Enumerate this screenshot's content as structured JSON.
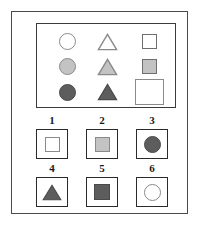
{
  "palette": {
    "white_fill": "#ffffff",
    "light_gray_fill": "#c3c3c3",
    "dark_gray_fill": "#5d5d5d",
    "shape_outline": "#8a8a8a",
    "dark_outline": "#4a4a4a",
    "frame": "#3a3a3a",
    "text": "#1a1a1a"
  },
  "puzzle": {
    "type": "matrix-reasoning",
    "rows": 3,
    "columns": 3,
    "missing_cell": {
      "row": 3,
      "column": 3
    },
    "rule_row": "shading progresses white, light gray, dark gray down each column",
    "rule_column": "shape is constant within a column: circle, triangle, square"
  },
  "matrix": {
    "name": "stimulus-matrix",
    "cells": [
      {
        "id": "cell-r1c1",
        "row": 1,
        "column": 1,
        "shape": "circle",
        "fill": "white",
        "label": "white circle"
      },
      {
        "id": "cell-r1c2",
        "row": 1,
        "column": 2,
        "shape": "triangle",
        "fill": "white",
        "label": "white triangle"
      },
      {
        "id": "cell-r1c3",
        "row": 1,
        "column": 3,
        "shape": "square",
        "fill": "white",
        "label": "white square"
      },
      {
        "id": "cell-r2c1",
        "row": 2,
        "column": 1,
        "shape": "circle",
        "fill": "light-gray",
        "label": "light gray circle"
      },
      {
        "id": "cell-r2c2",
        "row": 2,
        "column": 2,
        "shape": "triangle",
        "fill": "light-gray",
        "label": "light gray triangle"
      },
      {
        "id": "cell-r2c3",
        "row": 2,
        "column": 3,
        "shape": "square",
        "fill": "light-gray",
        "label": "light gray square"
      },
      {
        "id": "cell-r3c1",
        "row": 3,
        "column": 1,
        "shape": "circle",
        "fill": "dark-gray",
        "label": "dark gray circle"
      },
      {
        "id": "cell-r3c2",
        "row": 3,
        "column": 2,
        "shape": "triangle",
        "fill": "dark-gray",
        "label": "dark gray triangle"
      },
      {
        "id": "cell-r3c3",
        "row": 3,
        "column": 3,
        "shape": "blank",
        "fill": "none",
        "label": "empty answer box"
      }
    ]
  },
  "options": {
    "name": "answer-options",
    "count": 6,
    "items": [
      {
        "number": "1",
        "shape": "square",
        "fill": "white",
        "label": "white square"
      },
      {
        "number": "2",
        "shape": "square",
        "fill": "light-gray",
        "label": "light gray square"
      },
      {
        "number": "3",
        "shape": "circle",
        "fill": "dark-gray",
        "label": "dark gray circle"
      },
      {
        "number": "4",
        "shape": "triangle",
        "fill": "dark-gray",
        "label": "dark gray triangle"
      },
      {
        "number": "5",
        "shape": "square",
        "fill": "dark-gray",
        "label": "dark gray square"
      },
      {
        "number": "6",
        "shape": "circle",
        "fill": "white",
        "label": "white circle"
      }
    ]
  }
}
